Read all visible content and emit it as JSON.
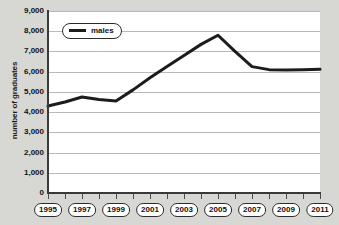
{
  "chart_data": {
    "type": "line",
    "title": "",
    "xlabel": "",
    "ylabel": "number of graduates",
    "xlim": [
      1995,
      2011
    ],
    "ylim": [
      0,
      9000
    ],
    "ytick_step": 1000,
    "grid": true,
    "legend_position": "top-left",
    "x": [
      1995,
      1996,
      1997,
      1998,
      1999,
      2000,
      2001,
      2002,
      2003,
      2004,
      2005,
      2006,
      2007,
      2008,
      2009,
      2010,
      2011
    ],
    "series": [
      {
        "name": "males",
        "color": "#1c1c1c",
        "values": [
          4300,
          4500,
          4750,
          4620,
          4550,
          5100,
          5700,
          6250,
          6800,
          7350,
          7800,
          7000,
          6250,
          6100,
          6080,
          6100,
          6120
        ]
      }
    ],
    "ytick_labels": [
      "9,000",
      "8,000",
      "7,000",
      "6,000",
      "5,000",
      "4,000",
      "3,000",
      "2,000",
      "1,000",
      "0"
    ],
    "ytick_values": [
      9000,
      8000,
      7000,
      6000,
      5000,
      4000,
      3000,
      2000,
      1000,
      0
    ],
    "xtick_values": [
      1995,
      1996,
      1997,
      1998,
      1999,
      2000,
      2001,
      2002,
      2003,
      2004,
      2005,
      2006,
      2007,
      2008,
      2009,
      2010,
      2011
    ],
    "xtick_labels": [
      "1995",
      "1997",
      "1999",
      "2001",
      "2003",
      "2005",
      "2007",
      "2009",
      "2011"
    ],
    "xtick_label_values": [
      1995,
      1997,
      1999,
      2001,
      2003,
      2005,
      2007,
      2009,
      2011
    ]
  },
  "legend": {
    "items": [
      {
        "label": "males",
        "color": "#1c1c1c"
      }
    ]
  },
  "axes": {
    "y_title": "number of graduates"
  },
  "colors": {
    "background": "#d7d7d4",
    "plot_background": "#ffffff",
    "gridline": "#b9b9b9",
    "axis": "#3a3a3a",
    "series": "#1c1c1c",
    "text": "#111111"
  }
}
